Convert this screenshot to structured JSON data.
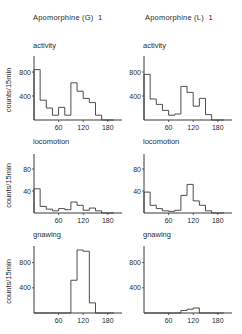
{
  "chart_data": [
    {
      "type": "line",
      "column": "Apomorphine (G) 1",
      "title": "activity",
      "ylabel": "counts/15min",
      "xlabel": "",
      "xticks": [
        60,
        120,
        180
      ],
      "yticks": [
        400,
        800
      ],
      "ylim": [
        0,
        1000
      ],
      "xlim": [
        0,
        210
      ],
      "bin_width": 15,
      "x": [
        0,
        15,
        30,
        45,
        60,
        75,
        90,
        105,
        120,
        135,
        150,
        165,
        180
      ],
      "values": [
        840,
        330,
        200,
        80,
        210,
        80,
        620,
        480,
        360,
        290,
        80,
        0,
        0
      ]
    },
    {
      "type": "line",
      "column": "Apomorphine (L) 1",
      "title": "activity",
      "ylabel": "",
      "xlabel": "",
      "xticks": [
        60,
        120,
        180
      ],
      "yticks": [
        400,
        800
      ],
      "ylim": [
        0,
        1000
      ],
      "xlim": [
        0,
        210
      ],
      "bin_width": 15,
      "x": [
        0,
        15,
        30,
        45,
        60,
        75,
        90,
        105,
        120,
        135,
        150,
        165,
        180
      ],
      "values": [
        760,
        350,
        260,
        160,
        80,
        100,
        560,
        460,
        230,
        360,
        90,
        0,
        0
      ]
    },
    {
      "type": "line",
      "column": "Apomorphine (G) 1",
      "title": "locomotion",
      "ylabel": "counts/15min",
      "xlabel": "",
      "xticks": [
        60,
        120,
        180
      ],
      "yticks": [
        40,
        80
      ],
      "ylim": [
        0,
        100
      ],
      "xlim": [
        0,
        210
      ],
      "bin_width": 15,
      "x": [
        0,
        15,
        30,
        45,
        60,
        75,
        90,
        105,
        120,
        135,
        150,
        165,
        180
      ],
      "values": [
        44,
        12,
        7,
        4,
        8,
        6,
        20,
        14,
        5,
        9,
        4,
        0,
        0
      ]
    },
    {
      "type": "line",
      "column": "Apomorphine (L) 1",
      "title": "locomotion",
      "ylabel": "",
      "xlabel": "",
      "xticks": [
        60,
        120,
        180
      ],
      "yticks": [
        40,
        80
      ],
      "ylim": [
        0,
        100
      ],
      "xlim": [
        0,
        210
      ],
      "bin_width": 15,
      "x": [
        0,
        15,
        30,
        45,
        60,
        75,
        90,
        105,
        120,
        135,
        150,
        165,
        180
      ],
      "values": [
        38,
        14,
        8,
        4,
        3,
        5,
        32,
        52,
        22,
        14,
        4,
        0,
        0
      ]
    },
    {
      "type": "line",
      "column": "Apomorphine (G) 1",
      "title": "gnawing",
      "ylabel": "counts/15min",
      "xlabel": "",
      "xticks": [
        60,
        120,
        180
      ],
      "yticks": [
        400,
        800
      ],
      "ylim": [
        0,
        1000
      ],
      "xlim": [
        0,
        210
      ],
      "bin_width": 15,
      "x": [
        0,
        15,
        30,
        45,
        60,
        75,
        90,
        105,
        120,
        135,
        150,
        165,
        180
      ],
      "values": [
        0,
        0,
        0,
        0,
        0,
        0,
        520,
        1000,
        980,
        160,
        0,
        0,
        0
      ]
    },
    {
      "type": "line",
      "column": "Apomorphine (L) 1",
      "title": "gnawing",
      "ylabel": "",
      "xlabel": "",
      "xticks": [
        60,
        120,
        180
      ],
      "yticks": [
        400,
        800
      ],
      "ylim": [
        0,
        1000
      ],
      "xlim": [
        0,
        210
      ],
      "bin_width": 15,
      "x": [
        0,
        15,
        30,
        45,
        60,
        75,
        90,
        105,
        120,
        135,
        150,
        165,
        180
      ],
      "values": [
        0,
        0,
        0,
        0,
        0,
        0,
        40,
        60,
        80,
        0,
        0,
        0,
        0
      ]
    }
  ],
  "headers": {
    "left": "Apomorphine (G)  1",
    "right": "Apomorphine (L)  1"
  },
  "panel_titles": {
    "activity": "activity",
    "locomotion": "locomotion",
    "gnawing": "gnawing"
  },
  "ylabel": "counts/15min",
  "colors": {
    "line": "#3a3a3a",
    "text": "#2a2a2a"
  }
}
